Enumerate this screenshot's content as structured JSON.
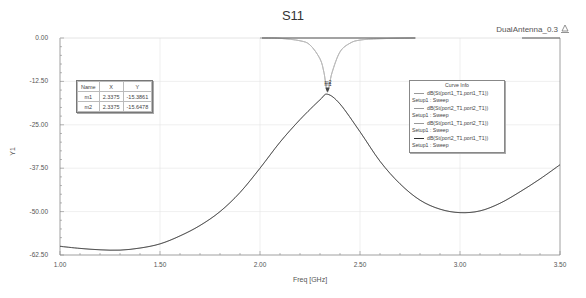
{
  "header": {
    "title": "S11",
    "design_name": "DualAntenna_0.3",
    "design_icon": "ansys-logo-icon"
  },
  "axes": {
    "ylabel": "Y1",
    "xlabel": "Freq [GHz]",
    "yticks": [
      "0.00",
      "-12.50",
      "-25.00",
      "-37.50",
      "-50.00",
      "-62.50"
    ],
    "xticks": [
      "1.00",
      "1.50",
      "2.00",
      "2.50",
      "3.00",
      "3.50"
    ]
  },
  "markers": {
    "header": [
      "Name",
      "X",
      "Y"
    ],
    "rows": [
      [
        "m1",
        "2.3375",
        "-15.3861"
      ],
      [
        "m2",
        "2.3375",
        "-15.6478"
      ]
    ],
    "labels": [
      "m1",
      "m2"
    ]
  },
  "legend": {
    "title": "Curve Info",
    "entries": [
      {
        "trace": "dB(St(port1_T1,port1_T1))",
        "setup": "Setup1 : Sweep"
      },
      {
        "trace": "dB(St(port2_T1,port2_T1))",
        "setup": "Setup1 : Sweep"
      },
      {
        "trace": "dB(St(port1_T1,port2_T1))",
        "setup": "Setup1 : Sweep"
      },
      {
        "trace": "dB(St(port2_T1,port1_T1))",
        "setup": "Setup1 : Sweep"
      }
    ]
  },
  "chart_data": {
    "type": "line",
    "title": "S11",
    "xlabel": "Freq [GHz]",
    "ylabel": "Y1",
    "xlim": [
      1.0,
      3.5
    ],
    "ylim": [
      -62.5,
      0.0
    ],
    "grid": true,
    "legend_position": "upper right (inside plot)",
    "series": [
      {
        "name": "dB(St(port1_T1,port1_T1)) Setup1 : Sweep",
        "x": [
          2.0,
          2.1,
          2.2,
          2.25,
          2.3,
          2.32,
          2.3375,
          2.36,
          2.4,
          2.45,
          2.5,
          2.6,
          2.78
        ],
        "values": [
          0.0,
          -0.1,
          -0.8,
          -2.0,
          -6.0,
          -10.0,
          -15.39,
          -10.0,
          -4.0,
          -1.5,
          -0.6,
          -0.2,
          0.0
        ]
      },
      {
        "name": "dB(St(port2_T1,port2_T1)) Setup1 : Sweep",
        "x": [
          2.0,
          2.1,
          2.2,
          2.25,
          2.3,
          2.32,
          2.3375,
          2.36,
          2.4,
          2.45,
          2.5,
          2.6,
          2.78
        ],
        "values": [
          0.0,
          -0.1,
          -0.8,
          -2.0,
          -6.0,
          -10.0,
          -15.65,
          -10.0,
          -4.0,
          -1.5,
          -0.6,
          -0.2,
          0.0
        ]
      },
      {
        "name": "dB(St(port1_T1,port2_T1)) Setup1 : Sweep",
        "x": [
          1.0,
          1.1,
          1.2,
          1.3,
          1.4,
          1.5,
          1.6,
          1.7,
          1.8,
          1.9,
          2.0,
          2.1,
          2.2,
          2.3,
          2.3375,
          2.4,
          2.5,
          2.6,
          2.7,
          2.8,
          2.9,
          3.0,
          3.1,
          3.2,
          3.3,
          3.4,
          3.5
        ],
        "values": [
          -60.0,
          -60.6,
          -61.0,
          -61.1,
          -60.5,
          -59.3,
          -57.0,
          -54.0,
          -50.0,
          -44.5,
          -37.5,
          -30.0,
          -23.5,
          -17.8,
          -16.2,
          -19.0,
          -27.0,
          -35.5,
          -42.0,
          -46.7,
          -49.3,
          -50.3,
          -49.8,
          -47.6,
          -44.3,
          -40.6,
          -36.5
        ]
      },
      {
        "name": "dB(St(port2_T1,port1_T1)) Setup1 : Sweep",
        "x": [
          1.0,
          1.1,
          1.2,
          1.3,
          1.4,
          1.5,
          1.6,
          1.7,
          1.8,
          1.9,
          2.0,
          2.1,
          2.2,
          2.3,
          2.3375,
          2.4,
          2.5,
          2.6,
          2.7,
          2.8,
          2.9,
          3.0,
          3.1,
          3.2,
          3.3,
          3.4,
          3.5
        ],
        "values": [
          -60.0,
          -60.6,
          -61.0,
          -61.1,
          -60.5,
          -59.3,
          -57.0,
          -54.0,
          -50.0,
          -44.5,
          -37.5,
          -30.0,
          -23.5,
          -17.8,
          -16.2,
          -19.0,
          -27.0,
          -35.5,
          -42.0,
          -46.7,
          -49.3,
          -50.3,
          -49.8,
          -47.6,
          -44.3,
          -40.6,
          -36.5
        ]
      }
    ],
    "markers": [
      {
        "name": "m1",
        "x": 2.3375,
        "y": -15.3861
      },
      {
        "name": "m2",
        "x": 2.3375,
        "y": -15.6478
      }
    ]
  }
}
